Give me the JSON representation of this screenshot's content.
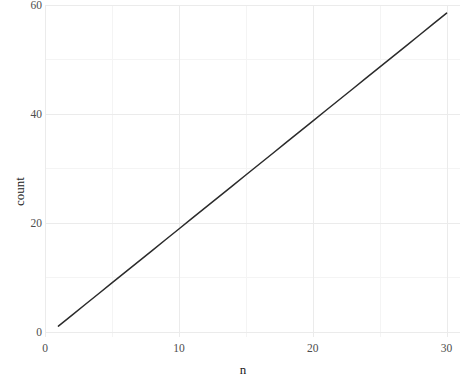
{
  "chart_data": {
    "type": "line",
    "title": "",
    "subtitle": "",
    "xlabel": "n",
    "ylabel": "count",
    "xlim": [
      0,
      31
    ],
    "ylim": [
      -1,
      60
    ],
    "grid": true,
    "legend": null,
    "x_ticks": [
      {
        "value": 0,
        "label": "0"
      },
      {
        "value": 10,
        "label": "10"
      },
      {
        "value": 20,
        "label": "20"
      },
      {
        "value": 30,
        "label": "30"
      }
    ],
    "y_ticks": [
      {
        "value": 0,
        "label": "0"
      },
      {
        "value": 20,
        "label": "20"
      },
      {
        "value": 40,
        "label": "40"
      },
      {
        "value": 60,
        "label": "60"
      }
    ],
    "x_minor_ticks": [
      5,
      15,
      25
    ],
    "y_minor_ticks": [
      10,
      30,
      50
    ],
    "series": [
      {
        "name": "count",
        "color": "#2b2b2b",
        "width": 1.5,
        "x": [
          1,
          2,
          3,
          4,
          5,
          6,
          7,
          8,
          9,
          10,
          11,
          12,
          13,
          14,
          15,
          16,
          17,
          18,
          19,
          20,
          21,
          22,
          23,
          24,
          25,
          26,
          27,
          28,
          29,
          30
        ],
        "values": [
          1,
          2.98,
          4.97,
          6.95,
          8.93,
          10.91,
          12.9,
          14.88,
          16.86,
          18.84,
          20.83,
          22.81,
          24.79,
          26.78,
          28.76,
          30.74,
          32.72,
          34.71,
          36.69,
          38.67,
          40.66,
          42.64,
          44.62,
          46.6,
          48.59,
          50.57,
          52.55,
          54.53,
          56.52,
          58.5
        ]
      }
    ]
  },
  "style": {
    "panel_background": "#ffffff",
    "gridline_major_color": "#ebebeb",
    "gridline_minor_color": "#f4f4f4",
    "line_color": "#2b2b2b",
    "tick_label_color": "#4d4d4d",
    "axis_title_color": "#1a1a1a"
  }
}
